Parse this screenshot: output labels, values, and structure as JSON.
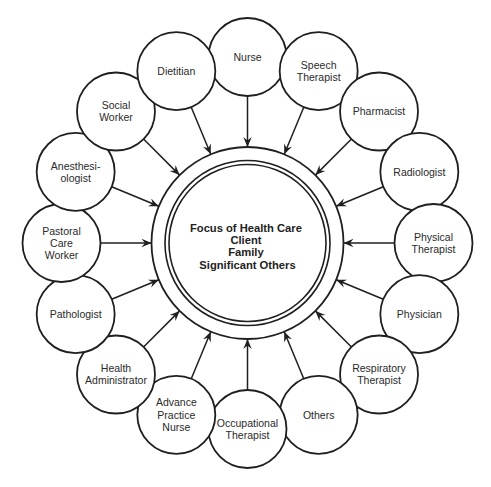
{
  "diagram": {
    "title": "Focus of Health Care",
    "center": {
      "lines": [
        "Focus of Health Care",
        "Client",
        "Family",
        "Significant Others"
      ]
    },
    "nodes": [
      {
        "id": "nurse",
        "lines": [
          "Nurse"
        ]
      },
      {
        "id": "speech-therapist",
        "lines": [
          "Speech",
          "Therapist"
        ]
      },
      {
        "id": "pharmacist",
        "lines": [
          "Pharmacist"
        ]
      },
      {
        "id": "radiologist",
        "lines": [
          "Radiologist"
        ]
      },
      {
        "id": "physical-therapist",
        "lines": [
          "Physical",
          "Therapist"
        ]
      },
      {
        "id": "physician",
        "lines": [
          "Physician"
        ]
      },
      {
        "id": "respiratory-therapist",
        "lines": [
          "Respiratory",
          "Therapist"
        ]
      },
      {
        "id": "others",
        "lines": [
          "Others"
        ]
      },
      {
        "id": "occupational-therapist",
        "lines": [
          "Occupational",
          "Therapist"
        ]
      },
      {
        "id": "advance-practice-nurse",
        "lines": [
          "Advance",
          "Practice",
          "Nurse"
        ]
      },
      {
        "id": "health-administrator",
        "lines": [
          "Health",
          "Administrator"
        ]
      },
      {
        "id": "pathologist",
        "lines": [
          "Pathologist"
        ]
      },
      {
        "id": "pastoral-care-worker",
        "lines": [
          "Pastoral",
          "Care",
          "Worker"
        ]
      },
      {
        "id": "anesthesiologist",
        "lines": [
          "Anesthesi-",
          "ologist"
        ]
      },
      {
        "id": "social-worker",
        "lines": [
          "Social",
          "Worker"
        ]
      },
      {
        "id": "dietitian",
        "lines": [
          "Dietitian"
        ]
      }
    ],
    "edges": "each node points with an arrow to the central circle",
    "colors": {
      "stroke": "#1f1f1f",
      "background": "#ffffff",
      "text": "#2a2a2a"
    }
  }
}
